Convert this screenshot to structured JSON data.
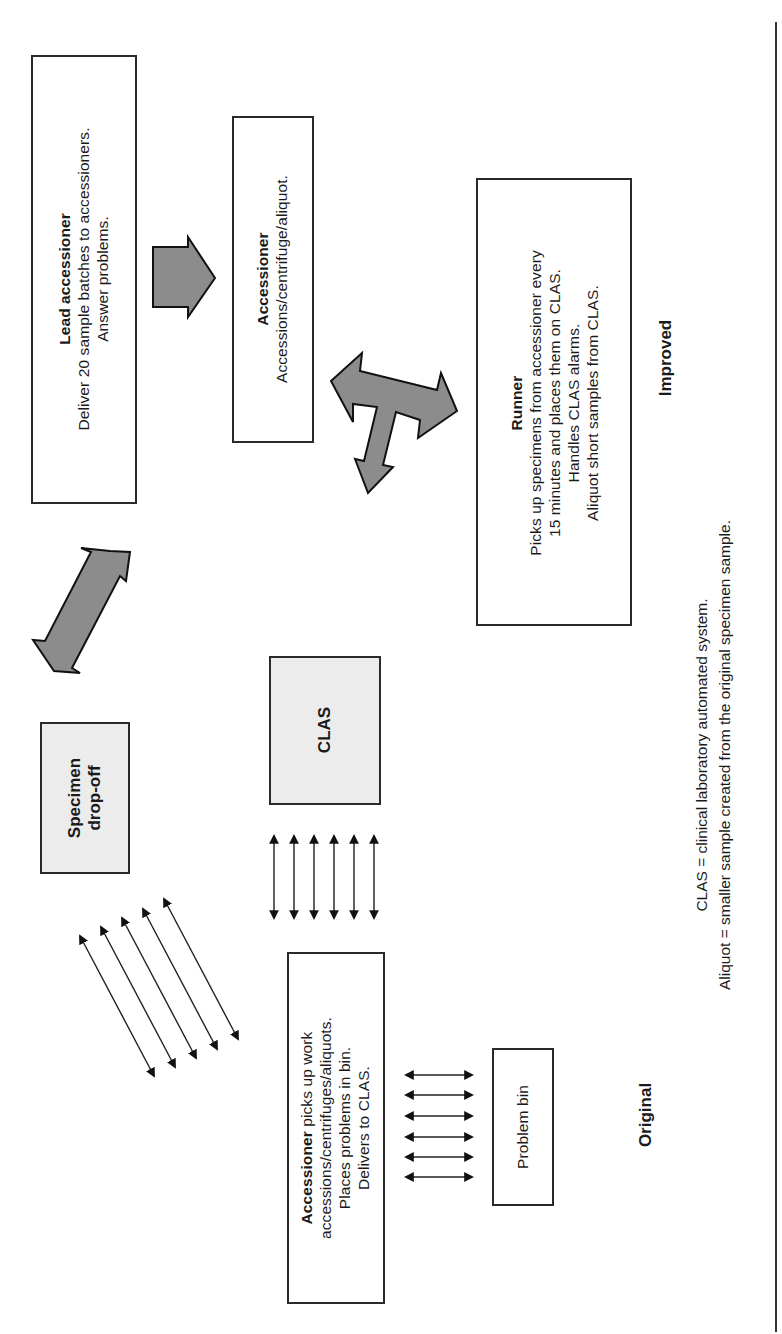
{
  "improved": {
    "section_label": "Improved",
    "lead_accessioner": {
      "title": "Lead accessioner",
      "lines": [
        "Deliver 20 sample batches to accessioners.",
        "Answer problems."
      ]
    },
    "accessioner": {
      "title": "Accessioner",
      "lines": [
        "Accessions/centrifuge/aliquot."
      ]
    },
    "runner": {
      "title": "Runner",
      "lines": [
        "Picks up specimens from accessioner every",
        "15 minutes and places them on CLAS.",
        "Handles CLAS alarms.",
        "Aliquot short samples from CLAS."
      ]
    }
  },
  "original": {
    "section_label": "Original",
    "specimen_dropoff": {
      "lines": [
        "Specimen",
        "drop-off"
      ]
    },
    "clas": {
      "label": "CLAS"
    },
    "accessioner": {
      "title": "Accessioner",
      "title_suffix": " picks up work",
      "lines": [
        "accessions/centrifuges/aliquots.",
        "Places problems in bin.",
        "Delivers to CLAS."
      ]
    },
    "problem_bin": {
      "label": "Problem bin"
    }
  },
  "legend": {
    "lines": [
      "CLAS = clinical laboratory automated system.",
      "Aliquot = smaller sample created from the original specimen sample."
    ]
  },
  "colors": {
    "arrow_fill": "#8c8c8c",
    "arrow_stroke": "#111111",
    "shaded_box": "#ececec",
    "border": "#2a2a2a"
  }
}
